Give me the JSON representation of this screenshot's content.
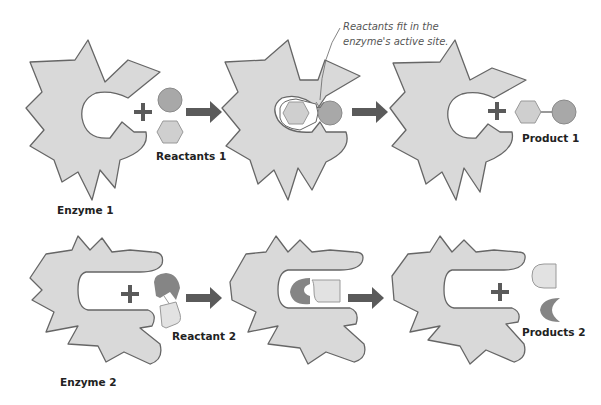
{
  "colors": {
    "enzyme_fill": "#d9d9d9",
    "enzyme_stroke": "#666666",
    "arrow": "#5a5a5a",
    "plus": "#5a5a5a",
    "circle_fill": "#a8a8a8",
    "hexagon_fill": "#cfcfcf",
    "dark_piece": "#858585",
    "light_piece": "#e2e2e2",
    "background": "#ffffff"
  },
  "row1": {
    "enzyme_label": "Enzyme 1",
    "reactants_label": "Reactants 1",
    "annotation": {
      "line1": "Reactants fit in the",
      "line2": "enzyme's active site."
    },
    "product_label": "Product 1"
  },
  "row2": {
    "enzyme_label": "Enzyme 2",
    "reactant_label": "Reactant 2",
    "products_label": "Products 2"
  }
}
